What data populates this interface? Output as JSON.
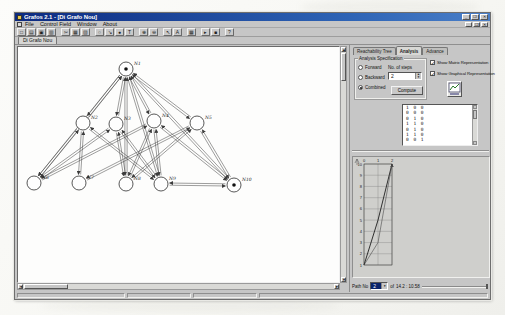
{
  "window": {
    "title": "Grafos 2.1 - [Di Grafo Nou]",
    "buttons": {
      "minimize": "_",
      "maximize": "❐",
      "close": "✕"
    }
  },
  "menu": {
    "items": [
      "File",
      "Control Field",
      "Window",
      "About"
    ],
    "mdi_buttons": {
      "minimize": "_",
      "restore": "❐",
      "close": "✕"
    }
  },
  "toolbar": {
    "groups": [
      {
        "buttons": [
          {
            "name": "new",
            "glyph": "□"
          },
          {
            "name": "open",
            "glyph": "▤"
          },
          {
            "name": "save",
            "glyph": "▣"
          },
          {
            "name": "print",
            "glyph": "▥"
          }
        ]
      },
      {
        "buttons": [
          {
            "name": "cut",
            "glyph": "✂"
          },
          {
            "name": "copy",
            "glyph": "▦"
          },
          {
            "name": "paste",
            "glyph": "▧"
          }
        ]
      },
      {
        "buttons": [
          {
            "name": "add-node",
            "glyph": "○"
          },
          {
            "name": "add-arc",
            "glyph": "↘"
          },
          {
            "name": "add-token",
            "glyph": "●"
          },
          {
            "name": "label",
            "glyph": "T"
          }
        ]
      },
      {
        "buttons": [
          {
            "name": "zoom-in",
            "glyph": "⊕"
          },
          {
            "name": "zoom-out",
            "glyph": "⊖"
          }
        ]
      },
      {
        "buttons": [
          {
            "name": "select",
            "glyph": "↖"
          },
          {
            "name": "text",
            "glyph": "A"
          }
        ]
      },
      {
        "buttons": [
          {
            "name": "grid",
            "glyph": "▦"
          }
        ]
      },
      {
        "buttons": [
          {
            "name": "run",
            "glyph": "▸"
          },
          {
            "name": "stop",
            "glyph": "■"
          }
        ]
      },
      {
        "buttons": [
          {
            "name": "help",
            "glyph": "?"
          }
        ]
      }
    ]
  },
  "document_tab": {
    "label": "Di Grafo Nou"
  },
  "right_panel": {
    "tabs": [
      {
        "label": "Reachability Tree",
        "active": false
      },
      {
        "label": "Analysis",
        "active": true
      },
      {
        "label": "Advance",
        "active": false
      }
    ],
    "analysis_spec": {
      "title": "Analysis Specification",
      "radios": [
        {
          "label": "Forward",
          "selected": false
        },
        {
          "label": "Backward",
          "selected": false
        },
        {
          "label": "Combined",
          "selected": true
        }
      ],
      "steps_label": "No. of steps",
      "steps_value": "2",
      "compute_label": "Compute"
    },
    "options": [
      {
        "label": "Show Matrix Representation",
        "checked": true
      },
      {
        "label": "Show Graphical Representation",
        "checked": true
      }
    ],
    "icon": "graphical-representation-icon",
    "matrix_rows": [
      "1 0 0",
      "0 0 0",
      "0 1 0",
      "1 1 0",
      "0 1 0",
      "1 1 0",
      "0 0 1"
    ],
    "path_bar": {
      "label": "Path No",
      "value": "2",
      "of_label": "of",
      "coords": "14.2 : 10.58"
    }
  },
  "graph": {
    "nodes": [
      {
        "id": 1,
        "label": "N1",
        "x": 108,
        "y": 22,
        "token": true
      },
      {
        "id": 2,
        "label": "N2",
        "x": 65,
        "y": 76,
        "token": false
      },
      {
        "id": 3,
        "label": "N3",
        "x": 98,
        "y": 77,
        "token": false
      },
      {
        "id": 4,
        "label": "N4",
        "x": 136,
        "y": 74,
        "token": false
      },
      {
        "id": 5,
        "label": "N5",
        "x": 179,
        "y": 76,
        "token": false
      },
      {
        "id": 6,
        "label": "N6",
        "x": 16,
        "y": 136,
        "token": false
      },
      {
        "id": 7,
        "label": "N7",
        "x": 61,
        "y": 136,
        "token": false
      },
      {
        "id": 8,
        "label": "N8",
        "x": 108,
        "y": 137,
        "token": false
      },
      {
        "id": 9,
        "label": "N9",
        "x": 143,
        "y": 137,
        "token": false
      },
      {
        "id": 10,
        "label": "N10",
        "x": 216,
        "y": 138,
        "token": true
      }
    ],
    "edges": [
      [
        1,
        2
      ],
      [
        1,
        3
      ],
      [
        1,
        4
      ],
      [
        1,
        5
      ],
      [
        1,
        6
      ],
      [
        1,
        8
      ],
      [
        1,
        9
      ],
      [
        1,
        10
      ],
      [
        2,
        6
      ],
      [
        2,
        7
      ],
      [
        2,
        9
      ],
      [
        3,
        6
      ],
      [
        3,
        8
      ],
      [
        3,
        9
      ],
      [
        4,
        6
      ],
      [
        4,
        8
      ],
      [
        4,
        9
      ],
      [
        4,
        10
      ],
      [
        5,
        7
      ],
      [
        5,
        8
      ],
      [
        5,
        10
      ],
      [
        9,
        10
      ]
    ]
  },
  "chart_data": {
    "type": "line",
    "title": "",
    "xlabel": "",
    "ylabel": "",
    "x_ticks": [
      0,
      1,
      2
    ],
    "y_ticks": [
      1,
      2,
      3,
      4,
      5,
      6,
      7,
      8,
      9,
      10
    ],
    "x_axis_position": "top",
    "grid": true,
    "series": [
      {
        "name": "path-a",
        "points": [
          [
            0,
            1
          ],
          [
            1,
            5
          ],
          [
            2,
            10
          ]
        ]
      },
      {
        "name": "path-b",
        "points": [
          [
            0,
            1
          ],
          [
            1,
            3
          ],
          [
            2,
            10
          ]
        ]
      }
    ]
  },
  "colors": {
    "titlebar": "#0c2a80",
    "chrome": "#c6c6c6",
    "canvas": "#fdfdfc",
    "stroke": "#3c3c3c",
    "combo_selected": "#0a246a"
  }
}
